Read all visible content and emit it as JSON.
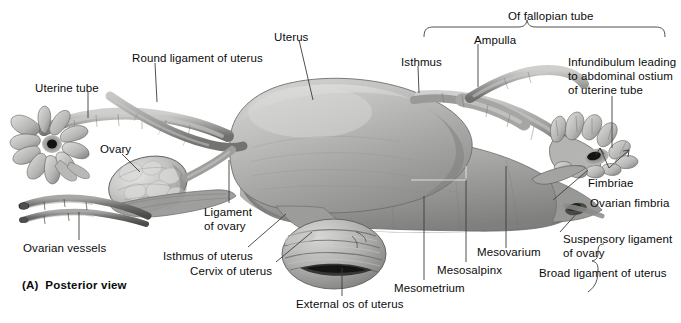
{
  "figure": {
    "caption": "(A)  Posterior view",
    "view_label": "Posterior view",
    "panel_letter": "(A)",
    "group_bracket_title": "Of fallopian tube",
    "background_color": "#ffffff",
    "text_color": "#0b0b0b",
    "leader_color": "#3d3d3d"
  },
  "labels": {
    "uterine_tube": "Uterine tube",
    "round_ligament_of_uterus": "Round ligament of uterus",
    "uterus": "Uterus",
    "of_fallopian_tube": "Of fallopian tube",
    "isthmus": "Isthmus",
    "ampulla": "Ampulla",
    "infundibulum": "Infundibulum leading\nto abdominal ostium\nof uterine tube",
    "ovary": "Ovary",
    "fimbriae": "Fimbriae",
    "ovarian_fimbria": "Ovarian fimbria",
    "ligament_of_ovary": "Ligament\nof ovary",
    "ovarian_vessels": "Ovarian vessels",
    "isthmus_of_uterus": "Isthmus of uterus",
    "cervix_of_uterus": "Cervix of uterus",
    "external_os_of_uterus": "External os of uterus",
    "mesometrium": "Mesometrium",
    "mesosalpinx": "Mesosalpinx",
    "mesovarium": "Mesovarium",
    "suspensory_ligament_of_ovary": "Suspensory ligament\nof ovary",
    "broad_ligament_of_uterus": "Broad ligament of uterus"
  },
  "structures": [
    "uterine tube",
    "round ligament of uterus",
    "uterus",
    "ovary",
    "ovarian vessels",
    "cervix of uterus",
    "external os of uterus",
    "fimbriae",
    "infundibulum",
    "ampulla",
    "isthmus",
    "broad ligament of uterus",
    "mesometrium",
    "mesosalpinx",
    "mesovarium",
    "suspensory ligament of ovary"
  ]
}
